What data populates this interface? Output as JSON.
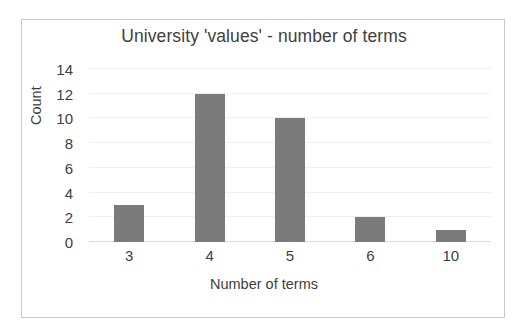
{
  "chart_data": {
    "type": "bar",
    "title": "University 'values' - number of terms",
    "xlabel": "Number of terms",
    "ylabel": "Count",
    "categories": [
      "3",
      "4",
      "5",
      "6",
      "10"
    ],
    "values": [
      3,
      12,
      10,
      2,
      1
    ],
    "ylim": [
      0,
      14
    ],
    "ytick_labels": [
      "0",
      "2",
      "4",
      "6",
      "8",
      "10",
      "12",
      "14"
    ],
    "ytick_values": [
      0,
      2,
      4,
      6,
      8,
      10,
      12,
      14
    ],
    "grid": "horizontal",
    "legend": "none",
    "series": [
      {
        "name": "Count",
        "values": [
          3,
          12,
          10,
          2,
          1
        ]
      }
    ]
  },
  "style": {
    "bar_color": "#7b7b7b",
    "gridline_color": "#efefef",
    "baseline_color": "#dcdcdc",
    "text_color": "#404040",
    "frame_color": "#c9c9c9",
    "background_color": "#ffffff"
  }
}
